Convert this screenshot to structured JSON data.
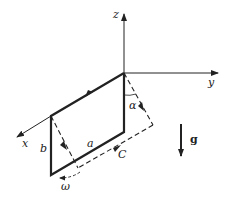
{
  "diagram": {
    "type": "physics-schematic",
    "axes": {
      "x_label": "x",
      "y_label": "y",
      "z_label": "z"
    },
    "labels": {
      "side_a": "a",
      "side_b": "b",
      "angle": "α",
      "circuit": "C",
      "angular_velocity": "ω",
      "gravity": "g"
    },
    "colors": {
      "stroke": "#222222",
      "background": "#ffffff"
    }
  }
}
